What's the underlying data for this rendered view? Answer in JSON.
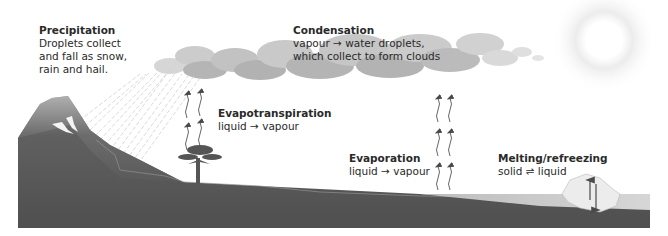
{
  "diagram": {
    "labels": {
      "precipitation": {
        "title": "Precipitation",
        "lines": [
          "Droplets collect",
          "and fall as snow,",
          "rain and hail."
        ]
      },
      "condensation": {
        "title": "Condensation",
        "lines": [
          "vapour → water droplets,",
          "which collect to form clouds"
        ]
      },
      "evapotranspiration": {
        "title": "Evapotranspiration",
        "lines": [
          "liquid → vapour"
        ]
      },
      "evaporation": {
        "title": "Evaporation",
        "lines": [
          "liquid → vapour"
        ]
      },
      "melting": {
        "title": "Melting/refreezing",
        "lines": [
          "solid ⇌ liquid"
        ]
      }
    },
    "elements": [
      "sun-icon",
      "cloud",
      "rain",
      "mountain",
      "tree-icon",
      "ground",
      "sea",
      "iceberg",
      "vapour-arrows"
    ],
    "colors": {
      "ground": "#5c5c5c",
      "ground_light": "#8a8a8a",
      "cloud": "#b5b5b5",
      "sea": "#c8c8c8",
      "text": "#2a2a2a",
      "sun": "#e4e4e4"
    }
  }
}
